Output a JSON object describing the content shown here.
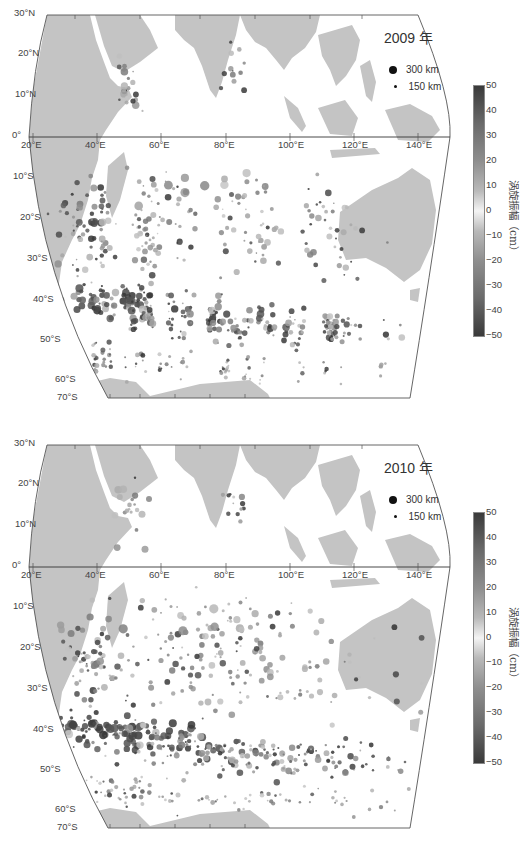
{
  "panels": [
    {
      "id": "panel-2009",
      "year_label": "2009 年",
      "top": 0
    },
    {
      "id": "panel-2010",
      "year_label": "2010 年",
      "top": 430
    }
  ],
  "axes": {
    "lat_labels": [
      "30°N",
      "20°N",
      "10°N",
      "0°",
      "10°S",
      "20°S",
      "30°S",
      "40°S",
      "50°S",
      "60°S",
      "70°S"
    ],
    "lon_labels": [
      "20°E",
      "40°E",
      "60°E",
      "80°E",
      "100°E",
      "120°E",
      "140°E"
    ]
  },
  "legend": {
    "large": "300 km",
    "small": "150 km"
  },
  "colorbar": {
    "title": "涡旋振幅（cm）",
    "ticks": [
      "50",
      "40",
      "30",
      "20",
      "10",
      "0",
      "−10",
      "−20",
      "−30",
      "−40",
      "−50"
    ]
  },
  "colors": {
    "land": "#c4c4c4",
    "frame": "#555555",
    "ocean": "#ffffff"
  },
  "chart_data": [
    {
      "type": "scatter",
      "title": "2009 年",
      "xlabel": "Longitude",
      "ylabel": "Latitude",
      "xlim": [
        20,
        150
      ],
      "ylim": [
        -70,
        30
      ],
      "color_variable": "涡旋振幅（cm）",
      "color_range": [
        -50,
        50
      ],
      "size_legend": [
        "300 km",
        "150 km"
      ],
      "x_ticks": [
        "20°E",
        "40°E",
        "60°E",
        "80°E",
        "100°E",
        "120°E",
        "140°E"
      ],
      "y_ticks": [
        "30°N",
        "20°N",
        "10°N",
        "0°",
        "10°S",
        "20°S",
        "30°S",
        "40°S",
        "50°S",
        "60°S",
        "70°S"
      ],
      "description": "Eddies concentrated along 35°S–45°S band (Agulhas Return Current) south of Africa, with dark (high amplitude) markers; scattered lighter eddies across the central Indian Ocean 10°S–35°S; small clusters in Arabian Sea and Bay of Bengal; Southern Ocean band around 45°S–55°S to 140°E."
    },
    {
      "type": "scatter",
      "title": "2010 年",
      "xlabel": "Longitude",
      "ylabel": "Latitude",
      "xlim": [
        20,
        150
      ],
      "ylim": [
        -70,
        30
      ],
      "color_variable": "涡旋振幅（cm）",
      "color_range": [
        -50,
        50
      ],
      "size_legend": [
        "300 km",
        "150 km"
      ],
      "x_ticks": [
        "20°E",
        "40°E",
        "60°E",
        "80°E",
        "100°E",
        "120°E",
        "140°E"
      ],
      "y_ticks": [
        "30°N",
        "20°N",
        "10°N",
        "0°",
        "10°S",
        "20°S",
        "30°S",
        "40°S",
        "50°S",
        "60°S",
        "70°S"
      ],
      "description": "Similar distribution to 2009: dense dark eddies along 38°S–45°S from 20°E to 60°E, Mozambique Channel cluster, large eddy near Somali coast (~4°N, 53°E), scattered eddies across 15°S–35°S, and Southern Ocean band to 140°E."
    }
  ]
}
